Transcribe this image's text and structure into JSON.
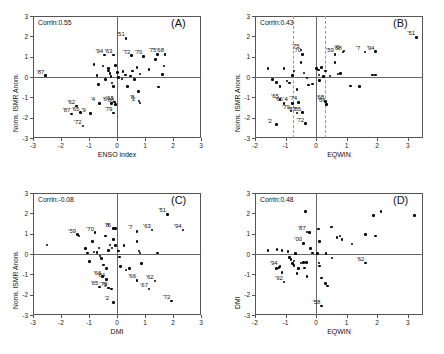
{
  "figure": {
    "width": 444,
    "height": 354,
    "point_color": "#000000",
    "axis_color": "#666666",
    "frame_color": "#555555"
  },
  "chart_data": [
    {
      "type": "scatter",
      "panel_id": "(A)",
      "title": "",
      "annotation": "Corrln:0.55",
      "correlation": 0.55,
      "xlabel": "ENSO index",
      "ylabel": "Norm. ISMR Anom.",
      "xlim": [
        -3,
        3
      ],
      "ylim": [
        -3,
        3
      ],
      "xticks": [
        -3,
        -2,
        -1,
        0,
        1,
        2,
        3
      ],
      "yticks": [
        -3,
        -2,
        -1,
        0,
        1,
        2,
        3
      ],
      "grid": false,
      "zero_lines": true,
      "points": [
        {
          "x": -2.55,
          "y": 0.07,
          "label": "'87"
        },
        {
          "x": -1.62,
          "y": -1.82,
          "label": "'87"
        },
        {
          "x": -1.45,
          "y": -1.42,
          "label": "'62"
        },
        {
          "x": -1.3,
          "y": -1.75,
          "label": "'65"
        },
        {
          "x": -0.95,
          "y": -1.8,
          "label": "'9"
        },
        {
          "x": -1.22,
          "y": -2.4,
          "label": "'72"
        },
        {
          "x": -0.62,
          "y": -1.3,
          "label": "'4"
        },
        {
          "x": -0.2,
          "y": -1.3,
          "label": "'6"
        },
        {
          "x": -0.08,
          "y": -1.22,
          "label": "'68"
        },
        {
          "x": -0.05,
          "y": -1.35,
          "label": "'66"
        },
        {
          "x": -0.12,
          "y": -1.78,
          "label": "'79"
        },
        {
          "x": -0.45,
          "y": 1.08,
          "label": "'94"
        },
        {
          "x": -0.12,
          "y": 1.08,
          "label": "'63"
        },
        {
          "x": 0.32,
          "y": 1.9,
          "label": "'51"
        },
        {
          "x": 0.52,
          "y": 1.05,
          "label": "'72"
        },
        {
          "x": 0.95,
          "y": 1.02,
          "label": "'70"
        },
        {
          "x": 1.45,
          "y": 1.12,
          "label": "'75"
        },
        {
          "x": 1.72,
          "y": 1.12,
          "label": "'68"
        },
        {
          "x": 0.78,
          "y": -1.18,
          "label": "'8"
        },
        {
          "x": 0.82,
          "y": -1.28,
          "label": "'2"
        },
        {
          "x": -0.82,
          "y": 0.62,
          "label": ""
        },
        {
          "x": -0.72,
          "y": 0.08,
          "label": ""
        },
        {
          "x": -0.66,
          "y": -0.38,
          "label": ""
        },
        {
          "x": -0.5,
          "y": 0.55,
          "label": ""
        },
        {
          "x": -0.42,
          "y": -0.12,
          "label": ""
        },
        {
          "x": -0.3,
          "y": 0.42,
          "label": ""
        },
        {
          "x": -0.3,
          "y": 0.3,
          "label": ""
        },
        {
          "x": -0.25,
          "y": 0.18,
          "label": ""
        },
        {
          "x": -0.22,
          "y": 0.02,
          "label": ""
        },
        {
          "x": -0.18,
          "y": -0.3,
          "label": ""
        },
        {
          "x": -0.12,
          "y": -0.48,
          "label": ""
        },
        {
          "x": -0.05,
          "y": 0.58,
          "label": ""
        },
        {
          "x": 0.02,
          "y": 0.22,
          "label": ""
        },
        {
          "x": 0.06,
          "y": -0.02,
          "label": ""
        },
        {
          "x": 0.18,
          "y": -0.1,
          "label": ""
        },
        {
          "x": 0.22,
          "y": 0.28,
          "label": ""
        },
        {
          "x": 0.3,
          "y": 0.1,
          "label": ""
        },
        {
          "x": 0.38,
          "y": -0.48,
          "label": ""
        },
        {
          "x": 0.48,
          "y": 0.05,
          "label": ""
        },
        {
          "x": 0.55,
          "y": 0.3,
          "label": ""
        },
        {
          "x": 0.62,
          "y": -0.12,
          "label": ""
        },
        {
          "x": 0.72,
          "y": 0.48,
          "label": ""
        },
        {
          "x": 0.76,
          "y": -0.72,
          "label": ""
        },
        {
          "x": 0.82,
          "y": 0.15,
          "label": ""
        },
        {
          "x": 1.15,
          "y": 0.38,
          "label": ""
        },
        {
          "x": 1.38,
          "y": 0.85,
          "label": ""
        },
        {
          "x": 1.48,
          "y": -0.5,
          "label": ""
        },
        {
          "x": 1.62,
          "y": 0.12,
          "label": ""
        },
        {
          "x": 1.68,
          "y": 0.55,
          "label": ""
        }
      ]
    },
    {
      "type": "scatter",
      "panel_id": "(B)",
      "title": "",
      "annotation": "Corrln:0.43",
      "correlation": 0.43,
      "xlabel": "EQWIN",
      "ylabel": "Norm. ISMR Anom.",
      "xlim": [
        -2,
        3.5
      ],
      "ylim": [
        -3,
        3
      ],
      "xticks": [
        -2,
        -1,
        0,
        1,
        2,
        3
      ],
      "yticks": [
        -3,
        -2,
        -1,
        0,
        1,
        2,
        3
      ],
      "grid": false,
      "zero_lines": true,
      "vlines_dashed": [
        -0.75,
        0.3
      ],
      "points": [
        {
          "x": 3.28,
          "y": 1.95,
          "label": "'51"
        },
        {
          "x": 1.95,
          "y": 1.25,
          "label": "'94"
        },
        {
          "x": 1.6,
          "y": 1.22,
          "label": "'7"
        },
        {
          "x": 0.62,
          "y": 1.12,
          "label": "'59"
        },
        {
          "x": 0.88,
          "y": 1.22,
          "label": "'68"
        },
        {
          "x": 0.92,
          "y": 1.28,
          "label": "'6"
        },
        {
          "x": -0.5,
          "y": 1.32,
          "label": "'75"
        },
        {
          "x": -0.45,
          "y": 1.12,
          "label": "'70"
        },
        {
          "x": -1.18,
          "y": -1.12,
          "label": "'65"
        },
        {
          "x": -1.05,
          "y": -1.3,
          "label": "'66"
        },
        {
          "x": -0.78,
          "y": -1.3,
          "label": "'4"
        },
        {
          "x": -0.58,
          "y": -1.25,
          "label": "'74"
        },
        {
          "x": 0.3,
          "y": -1.2,
          "label": "'68"
        },
        {
          "x": 0.35,
          "y": -1.35,
          "label": "'66"
        },
        {
          "x": -0.82,
          "y": -1.68,
          "label": "'79"
        },
        {
          "x": -0.62,
          "y": -1.78,
          "label": "'87"
        },
        {
          "x": -0.45,
          "y": -1.75,
          "label": "'85"
        },
        {
          "x": -1.3,
          "y": -2.35,
          "label": "'2"
        },
        {
          "x": -0.35,
          "y": -2.3,
          "label": "'72"
        },
        {
          "x": -1.58,
          "y": 0.42,
          "label": ""
        },
        {
          "x": -1.42,
          "y": -0.12,
          "label": ""
        },
        {
          "x": -1.3,
          "y": -0.28,
          "label": ""
        },
        {
          "x": -1.18,
          "y": -0.48,
          "label": ""
        },
        {
          "x": -1.05,
          "y": 0.42,
          "label": ""
        },
        {
          "x": -0.95,
          "y": -0.2,
          "label": ""
        },
        {
          "x": -0.88,
          "y": -0.3,
          "label": ""
        },
        {
          "x": -0.78,
          "y": 0.08,
          "label": ""
        },
        {
          "x": -0.72,
          "y": 0.3,
          "label": ""
        },
        {
          "x": -0.62,
          "y": -0.62,
          "label": ""
        },
        {
          "x": -0.5,
          "y": 0.72,
          "label": ""
        },
        {
          "x": -0.4,
          "y": 0.2,
          "label": ""
        },
        {
          "x": -0.3,
          "y": -0.05,
          "label": ""
        },
        {
          "x": -0.25,
          "y": -0.4,
          "label": ""
        },
        {
          "x": -0.12,
          "y": -0.35,
          "label": ""
        },
        {
          "x": 0.02,
          "y": 0.42,
          "label": ""
        },
        {
          "x": 0.08,
          "y": 0.35,
          "label": ""
        },
        {
          "x": 0.1,
          "y": 0.1,
          "label": ""
        },
        {
          "x": 0.12,
          "y": -0.18,
          "label": ""
        },
        {
          "x": 0.18,
          "y": 0.48,
          "label": ""
        },
        {
          "x": 0.25,
          "y": 0.02,
          "label": ""
        },
        {
          "x": 0.3,
          "y": 0.3,
          "label": ""
        },
        {
          "x": 0.45,
          "y": 0.05,
          "label": ""
        },
        {
          "x": 0.62,
          "y": 0.72,
          "label": ""
        },
        {
          "x": 0.72,
          "y": 0.15,
          "label": ""
        },
        {
          "x": 0.8,
          "y": 0.18,
          "label": ""
        },
        {
          "x": 1.12,
          "y": -0.45,
          "label": ""
        },
        {
          "x": 1.42,
          "y": -0.48,
          "label": ""
        },
        {
          "x": 1.85,
          "y": 0.1,
          "label": ""
        },
        {
          "x": 1.95,
          "y": 0.1,
          "label": ""
        }
      ]
    },
    {
      "type": "scatter",
      "panel_id": "(C)",
      "title": "",
      "annotation": "Corrln:-0.08",
      "correlation": -0.08,
      "xlabel": "DMI",
      "ylabel": "Norm. ISMR Anom.",
      "xlim": [
        -3,
        3
      ],
      "ylim": [
        -3,
        3
      ],
      "xticks": [
        -3,
        -2,
        -1,
        0,
        1,
        2,
        3
      ],
      "yticks": [
        -3,
        -2,
        -1,
        0,
        1,
        2,
        3
      ],
      "grid": false,
      "zero_lines": true,
      "points": [
        {
          "x": 1.8,
          "y": 1.95,
          "label": "'51"
        },
        {
          "x": 2.35,
          "y": 1.18,
          "label": "'94"
        },
        {
          "x": 1.25,
          "y": 1.18,
          "label": "'63"
        },
        {
          "x": 0.72,
          "y": 1.12,
          "label": "'7"
        },
        {
          "x": -1.42,
          "y": 0.95,
          "label": "'59"
        },
        {
          "x": -0.78,
          "y": 1.05,
          "label": "'70"
        },
        {
          "x": -0.12,
          "y": 1.25,
          "label": "'8"
        },
        {
          "x": -0.05,
          "y": 1.25,
          "label": "'6"
        },
        {
          "x": -0.52,
          "y": -1.12,
          "label": "'66"
        },
        {
          "x": -0.38,
          "y": -1.25,
          "label": "'84"
        },
        {
          "x": -0.62,
          "y": -1.62,
          "label": "'65"
        },
        {
          "x": -0.3,
          "y": -1.68,
          "label": "'79"
        },
        {
          "x": -0.2,
          "y": -1.72,
          "label": "'9"
        },
        {
          "x": 0.72,
          "y": -1.3,
          "label": "'66"
        },
        {
          "x": 1.35,
          "y": -1.32,
          "label": "'62"
        },
        {
          "x": 1.15,
          "y": -1.72,
          "label": "'67"
        },
        {
          "x": -0.12,
          "y": -2.38,
          "label": "'2"
        },
        {
          "x": 1.95,
          "y": -2.32,
          "label": "'72"
        },
        {
          "x": -2.5,
          "y": 0.45,
          "label": ""
        },
        {
          "x": -1.35,
          "y": 0.88,
          "label": ""
        },
        {
          "x": -1.12,
          "y": 0.28,
          "label": ""
        },
        {
          "x": -1.05,
          "y": 0.05,
          "label": ""
        },
        {
          "x": -0.98,
          "y": -0.38,
          "label": ""
        },
        {
          "x": -0.88,
          "y": 0.62,
          "label": ""
        },
        {
          "x": -0.82,
          "y": 0.1,
          "label": ""
        },
        {
          "x": -0.72,
          "y": 0.08,
          "label": ""
        },
        {
          "x": -0.65,
          "y": 0.3,
          "label": ""
        },
        {
          "x": -0.6,
          "y": -0.1,
          "label": ""
        },
        {
          "x": -0.55,
          "y": -0.22,
          "label": ""
        },
        {
          "x": -0.48,
          "y": -0.55,
          "label": ""
        },
        {
          "x": -0.42,
          "y": 0.88,
          "label": ""
        },
        {
          "x": -0.38,
          "y": -0.72,
          "label": ""
        },
        {
          "x": -0.3,
          "y": 0.18,
          "label": ""
        },
        {
          "x": -0.25,
          "y": 0.45,
          "label": ""
        },
        {
          "x": -0.18,
          "y": 0.3,
          "label": ""
        },
        {
          "x": -0.12,
          "y": 0.72,
          "label": ""
        },
        {
          "x": -0.05,
          "y": 0.42,
          "label": ""
        },
        {
          "x": 0.05,
          "y": 0.15,
          "label": ""
        },
        {
          "x": 0.08,
          "y": -0.15,
          "label": ""
        },
        {
          "x": 0.12,
          "y": -0.62,
          "label": ""
        },
        {
          "x": 0.25,
          "y": 0.42,
          "label": ""
        },
        {
          "x": 0.32,
          "y": -0.78,
          "label": ""
        },
        {
          "x": 0.45,
          "y": -0.7,
          "label": ""
        },
        {
          "x": 0.72,
          "y": 0.62,
          "label": ""
        },
        {
          "x": 0.78,
          "y": 0.15,
          "label": ""
        },
        {
          "x": 0.82,
          "y": 0.05,
          "label": ""
        },
        {
          "x": 0.88,
          "y": -0.48,
          "label": ""
        },
        {
          "x": 1.45,
          "y": 0.05,
          "label": ""
        }
      ]
    },
    {
      "type": "scatter",
      "panel_id": "(D)",
      "title": "",
      "annotation": "Corrln:0.48",
      "correlation": 0.48,
      "xlabel": "EQWIN",
      "ylabel": "DMI",
      "xlim": [
        -2,
        3.5
      ],
      "ylim": [
        -3,
        3
      ],
      "xticks": [
        -2,
        -1,
        0,
        1,
        2,
        3
      ],
      "yticks": [
        -3,
        -2,
        -1,
        0,
        1,
        2,
        3
      ],
      "grid": false,
      "zero_lines": true,
      "points": [
        {
          "x": -0.3,
          "y": 1.08,
          "label": "'87"
        },
        {
          "x": -0.42,
          "y": 0.52,
          "label": "'00"
        },
        {
          "x": -1.22,
          "y": -0.65,
          "label": "'94"
        },
        {
          "x": -1.05,
          "y": -1.38,
          "label": "'92"
        },
        {
          "x": 1.62,
          "y": -0.45,
          "label": "'62"
        },
        {
          "x": 0.18,
          "y": -2.55,
          "label": "'58"
        },
        {
          "x": -0.35,
          "y": 2.1,
          "label": ""
        },
        {
          "x": -0.22,
          "y": 1.05,
          "label": ""
        },
        {
          "x": -1.58,
          "y": 0.18,
          "label": ""
        },
        {
          "x": -1.28,
          "y": 0.22,
          "label": ""
        },
        {
          "x": -1.12,
          "y": 0.18,
          "label": ""
        },
        {
          "x": -1.18,
          "y": -0.62,
          "label": ""
        },
        {
          "x": -1.3,
          "y": -0.72,
          "label": ""
        },
        {
          "x": -1.12,
          "y": -0.92,
          "label": ""
        },
        {
          "x": -0.92,
          "y": 0.12,
          "label": ""
        },
        {
          "x": -0.88,
          "y": -0.18,
          "label": ""
        },
        {
          "x": -0.82,
          "y": -0.28,
          "label": ""
        },
        {
          "x": -0.78,
          "y": -0.48,
          "label": ""
        },
        {
          "x": -0.72,
          "y": -0.35,
          "label": ""
        },
        {
          "x": -0.72,
          "y": -0.58,
          "label": ""
        },
        {
          "x": -0.68,
          "y": 0.02,
          "label": ""
        },
        {
          "x": -0.62,
          "y": -0.95,
          "label": ""
        },
        {
          "x": -0.58,
          "y": -0.72,
          "label": ""
        },
        {
          "x": -0.5,
          "y": -0.45,
          "label": ""
        },
        {
          "x": -0.42,
          "y": -0.42,
          "label": ""
        },
        {
          "x": -0.38,
          "y": -0.68,
          "label": ""
        },
        {
          "x": -0.32,
          "y": -0.42,
          "label": ""
        },
        {
          "x": -0.3,
          "y": -1.12,
          "label": ""
        },
        {
          "x": -0.18,
          "y": 0.28,
          "label": ""
        },
        {
          "x": -0.12,
          "y": 0.05,
          "label": ""
        },
        {
          "x": 0.08,
          "y": 1.22,
          "label": ""
        },
        {
          "x": 0.12,
          "y": 0.62,
          "label": ""
        },
        {
          "x": 0.05,
          "y": 0.02,
          "label": ""
        },
        {
          "x": 0.1,
          "y": -0.45,
          "label": ""
        },
        {
          "x": 0.12,
          "y": -0.6,
          "label": ""
        },
        {
          "x": 0.18,
          "y": -1.18,
          "label": ""
        },
        {
          "x": 0.3,
          "y": -1.45,
          "label": ""
        },
        {
          "x": 0.38,
          "y": -1.58,
          "label": ""
        },
        {
          "x": 0.32,
          "y": 0.02,
          "label": ""
        },
        {
          "x": 0.5,
          "y": 1.32,
          "label": ""
        },
        {
          "x": 0.52,
          "y": -0.2,
          "label": ""
        },
        {
          "x": 0.68,
          "y": 0.82,
          "label": ""
        },
        {
          "x": 0.78,
          "y": 0.88,
          "label": ""
        },
        {
          "x": 0.85,
          "y": 0.72,
          "label": ""
        },
        {
          "x": 1.18,
          "y": 0.5,
          "label": ""
        },
        {
          "x": 1.62,
          "y": 0.95,
          "label": ""
        },
        {
          "x": 1.88,
          "y": 1.88,
          "label": ""
        },
        {
          "x": 1.95,
          "y": 0.88,
          "label": ""
        },
        {
          "x": 2.12,
          "y": 2.1,
          "label": ""
        },
        {
          "x": 3.22,
          "y": 1.9,
          "label": ""
        }
      ]
    }
  ]
}
